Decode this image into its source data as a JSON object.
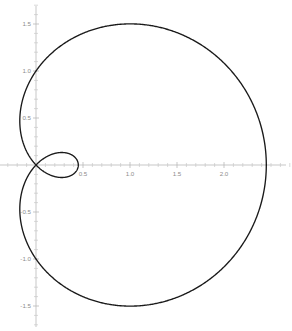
{
  "chart_data": {
    "type": "line",
    "subtype": "polar-parametric",
    "title": "",
    "subtitle": "",
    "xlabel": "",
    "ylabel": "",
    "curve_name": "limacon with inner loop",
    "polar_equation": "r = 1 + 1.45 cos(theta)",
    "parameters": {
      "a": 1,
      "b": 1.45
    },
    "theta_range": [
      0,
      6.283185307179586
    ],
    "xlim": [
      -0.38,
      2.72
    ],
    "ylim": [
      -1.76,
      1.76
    ],
    "grid": false,
    "legend": null,
    "axes_visible": true,
    "axes_style": "centered-crosshair",
    "line_color": "#1a1a1a",
    "axis_color": "#b9b9b9",
    "label_color": "#8c8c8c",
    "background_color": "#ffffff",
    "x_ticks": [
      {
        "value": 0.5,
        "label": "0.5"
      },
      {
        "value": 1.0,
        "label": "1.0"
      },
      {
        "value": 1.5,
        "label": "1.5"
      },
      {
        "value": 2.0,
        "label": "2.0"
      }
    ],
    "y_ticks": [
      {
        "value": 1.5,
        "label": "1.5"
      },
      {
        "value": 1.0,
        "label": "1.0"
      },
      {
        "value": 0.5,
        "label": "0.5"
      },
      {
        "value": -0.5,
        "label": "-0.5"
      },
      {
        "value": -1.0,
        "label": "-1.0"
      },
      {
        "value": -1.5,
        "label": "-1.5"
      }
    ],
    "x_minor_tick_step": 0.1,
    "y_minor_tick_step": 0.1,
    "key_points": {
      "rightmost_x": 2.45,
      "leftmost_x": -0.2,
      "top_y": 1.5,
      "bottom_y": -1.5,
      "inner_loop_max_x": 0.45,
      "origin_crossing": [
        0,
        0
      ]
    }
  },
  "plot": {
    "origin_px": {
      "x": 36,
      "y": 165
    },
    "scale_px_per_unit": 94
  }
}
